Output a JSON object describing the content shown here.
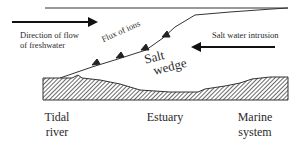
{
  "diagram": {
    "labels": {
      "freshwater_flow": [
        "Direction of flow",
        "of freshwater"
      ],
      "flux_of_ions": "Flux of ions",
      "salt_intrusion": "Salt water intrusion",
      "salt_wedge": [
        "Salt",
        "wedge"
      ]
    },
    "zones": {
      "tidal_river": [
        "Tidal",
        "river"
      ],
      "estuary": "Estuary",
      "marine_system": [
        "Marine",
        "system"
      ]
    },
    "colors": {
      "line": "#222222",
      "hatch": "#555555",
      "background": "#ffffff"
    }
  }
}
